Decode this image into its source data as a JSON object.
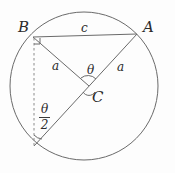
{
  "figure": {
    "background_color": "#fdfdfd",
    "stroke_color": "#6a6a6a",
    "text_color": "#2b2b2b",
    "width": 175,
    "height": 173
  },
  "circle": {
    "center_x": 84,
    "center_y": 86,
    "radius": 74
  },
  "points": {
    "A": {
      "label": "A",
      "x": 137,
      "y": 34,
      "label_x": 143,
      "label_y": 20
    },
    "B": {
      "label": "B",
      "x": 33,
      "y": 37,
      "label_x": 18,
      "label_y": 20
    },
    "C": {
      "label": "C",
      "x": 89,
      "y": 86,
      "label_x": 92,
      "label_y": 90
    },
    "D": {
      "label": "",
      "x": 34,
      "y": 146
    }
  },
  "segments": [
    {
      "name": "chord-BA",
      "from": "B",
      "to": "A",
      "style": "solid",
      "label": "c"
    },
    {
      "name": "radius-CB",
      "from": "C",
      "to": "B",
      "style": "solid",
      "label": "a"
    },
    {
      "name": "radius-CA",
      "from": "C",
      "to": "A",
      "style": "solid",
      "label": "a"
    },
    {
      "name": "diameter-A-D",
      "from": "A",
      "to": "D",
      "style": "solid",
      "label": ""
    },
    {
      "name": "dashed-B-D",
      "from": "B",
      "to": "D",
      "style": "dashed",
      "label": ""
    }
  ],
  "labels": {
    "side_c": {
      "text": "c",
      "x": 81,
      "y": 22
    },
    "side_a_left": {
      "text": "a",
      "x": 52,
      "y": 60
    },
    "side_a_right": {
      "text": "a",
      "x": 117,
      "y": 61
    },
    "angle_theta": {
      "text": "θ",
      "x": 87,
      "y": 64
    },
    "angle_half_theta_numerator": {
      "text": "θ"
    },
    "angle_half_theta_denominator": {
      "text": "2"
    },
    "angle_half_theta_x": 39,
    "angle_half_theta_y": 103
  },
  "markers": {
    "right_angle_at_B": {
      "x": 33,
      "y": 37,
      "size": 6
    },
    "arc_at_C_theta": {
      "radius": 9
    },
    "arc_at_C_lower": {
      "radius": 7
    },
    "arc_at_D_half_theta": {
      "radius": 11
    }
  }
}
